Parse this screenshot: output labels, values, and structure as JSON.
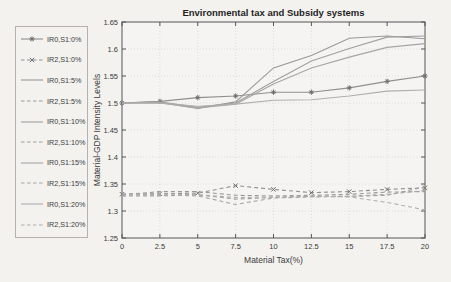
{
  "window": {
    "title": "Environmental tax and Subsidy systems"
  },
  "colors": {
    "background": "#f3f2ef",
    "plot_background": "#f5f4f2",
    "axis": "#555555",
    "grid": "#e0ded9",
    "text": "#3b3b3b",
    "title": "#1f1f1f",
    "legend_border": "#b5b2ad"
  },
  "chart_data": {
    "type": "line",
    "title": "Environmental tax and Subsidy systems",
    "xlabel": "Material Tax(%)",
    "ylabel": "Material-GDP Intensity Levels",
    "xlim": [
      0,
      20
    ],
    "ylim": [
      1.25,
      1.65
    ],
    "xticks": [
      "0",
      "2.5",
      "5",
      "7.5",
      "10",
      "12.5",
      "15",
      "17.5",
      "20"
    ],
    "yticks": [
      "1.25",
      "1.3",
      "1.35",
      "1.4",
      "1.45",
      "1.5",
      "1.55",
      "1.6",
      "1.65"
    ],
    "grid": true,
    "legend_position": "outside-left",
    "x": [
      0,
      2.5,
      5,
      7.5,
      10,
      12.5,
      15,
      17.5,
      20
    ],
    "series": [
      {
        "name": "IR0,S1:0%",
        "line": "solid",
        "marker": "asterisk",
        "color": "#8f8f8f",
        "marker_color": "#6f6f6f",
        "values": [
          1.5,
          1.503,
          1.51,
          1.513,
          1.52,
          1.52,
          1.528,
          1.54,
          1.55
        ]
      },
      {
        "name": "IR2,S1:0%",
        "line": "dashed",
        "marker": "x",
        "color": "#8f8f8f",
        "marker_color": "#6f6f6f",
        "values": [
          1.331,
          1.332,
          1.333,
          1.347,
          1.34,
          1.334,
          1.336,
          1.34,
          1.343
        ]
      },
      {
        "name": "IR0,S1:5%",
        "line": "solid",
        "marker": "none",
        "color": "#999999",
        "values": [
          1.5,
          1.501,
          1.49,
          1.502,
          1.565,
          1.588,
          1.62,
          1.624,
          1.619
        ]
      },
      {
        "name": "IR2,S1:5%",
        "line": "dashed",
        "marker": "none",
        "color": "#999999",
        "values": [
          1.33,
          1.336,
          1.336,
          1.329,
          1.328,
          1.329,
          1.331,
          1.335,
          1.336
        ]
      },
      {
        "name": "IR0,S1:10%",
        "line": "solid",
        "marker": "none",
        "color": "#a0a0a0",
        "values": [
          1.5,
          1.502,
          1.492,
          1.5,
          1.54,
          1.578,
          1.601,
          1.622,
          1.624
        ]
      },
      {
        "name": "IR2,S1:10%",
        "line": "dashed",
        "marker": "none",
        "color": "#a0a0a0",
        "values": [
          1.328,
          1.328,
          1.33,
          1.322,
          1.325,
          1.327,
          1.327,
          1.329,
          1.345
        ]
      },
      {
        "name": "IR0,S1:15%",
        "line": "solid",
        "marker": "none",
        "color": "#a6a6a6",
        "values": [
          1.5,
          1.5,
          1.491,
          1.498,
          1.535,
          1.565,
          1.585,
          1.603,
          1.61
        ]
      },
      {
        "name": "IR2,S1:15%",
        "line": "dashed",
        "marker": "none",
        "color": "#a6a6a6",
        "values": [
          1.332,
          1.33,
          1.328,
          1.312,
          1.324,
          1.326,
          1.327,
          1.331,
          1.338
        ]
      },
      {
        "name": "IR0,S1:20%",
        "line": "solid",
        "marker": "none",
        "color": "#aeaeae",
        "values": [
          1.5,
          1.5,
          1.494,
          1.498,
          1.505,
          1.506,
          1.513,
          1.522,
          1.524
        ]
      },
      {
        "name": "IR2,S1:20%",
        "line": "dashed",
        "marker": "none",
        "color": "#aeaeae",
        "values": [
          1.33,
          1.332,
          1.33,
          1.325,
          1.326,
          1.328,
          1.326,
          1.316,
          1.302
        ]
      }
    ]
  }
}
